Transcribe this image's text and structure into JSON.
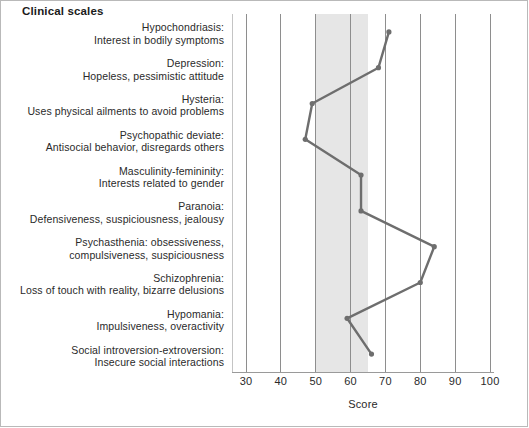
{
  "chart_title": "Clinical scales",
  "chart_data": {
    "type": "line",
    "title": "Clinical scales",
    "orientation": "horizontal",
    "xlabel": "Score",
    "ylabel": "",
    "xlim": [
      26,
      100
    ],
    "xticks": [
      30,
      40,
      50,
      60,
      70,
      80,
      90,
      100
    ],
    "xtick_labels": [
      "30",
      "40",
      "50",
      "60",
      "70",
      "80",
      "90",
      "100"
    ],
    "grid": true,
    "legend": "none",
    "normal_range_band": {
      "from": 50,
      "to": 65,
      "color": "#e6e6e6"
    },
    "line_color": "#6e6e6e",
    "marker": "circle",
    "categories": [
      "Hypochondriasis",
      "Depression",
      "Hysteria",
      "Psychopathic deviate",
      "Masculinity-femininity",
      "Paranoia",
      "Psychasthenia",
      "Schizophrenia",
      "Hypomania",
      "Social introversion-extroversion"
    ],
    "values": [
      71,
      68,
      49,
      47,
      63,
      63,
      84,
      80,
      59,
      66
    ],
    "scales": [
      {
        "name": "Hypochondriasis",
        "label_lines": [
          "Hypochondriasis:",
          "Interest in bodily symptoms"
        ],
        "score": 71
      },
      {
        "name": "Depression",
        "label_lines": [
          "Depression:",
          "Hopeless, pessimistic attitude"
        ],
        "score": 68
      },
      {
        "name": "Hysteria",
        "label_lines": [
          "Hysteria:",
          "Uses physical ailments to avoid problems"
        ],
        "score": 49
      },
      {
        "name": "Psychopathic deviate",
        "label_lines": [
          "Psychopathic deviate:",
          "Antisocial behavior, disregards others"
        ],
        "score": 47
      },
      {
        "name": "Masculinity-femininity",
        "label_lines": [
          "Masculinity-femininity:",
          "Interests related to gender"
        ],
        "score": 63
      },
      {
        "name": "Paranoia",
        "label_lines": [
          "Paranoia:",
          "Defensiveness, suspiciousness, jealousy"
        ],
        "score": 63
      },
      {
        "name": "Psychasthenia",
        "label_lines": [
          "Psychasthenia: obsessiveness,",
          "compulsiveness, suspiciousness"
        ],
        "score": 84
      },
      {
        "name": "Schizophrenia",
        "label_lines": [
          "Schizophrenia:",
          "Loss of touch with reality, bizarre delusions"
        ],
        "score": 80
      },
      {
        "name": "Hypomania",
        "label_lines": [
          "Hypomania:",
          "Impulsiveness, overactivity"
        ],
        "score": 59
      },
      {
        "name": "Social introversion-extroversion",
        "label_lines": [
          "Social introversion-extroversion:",
          "Insecure social interactions"
        ],
        "score": 66
      }
    ]
  }
}
